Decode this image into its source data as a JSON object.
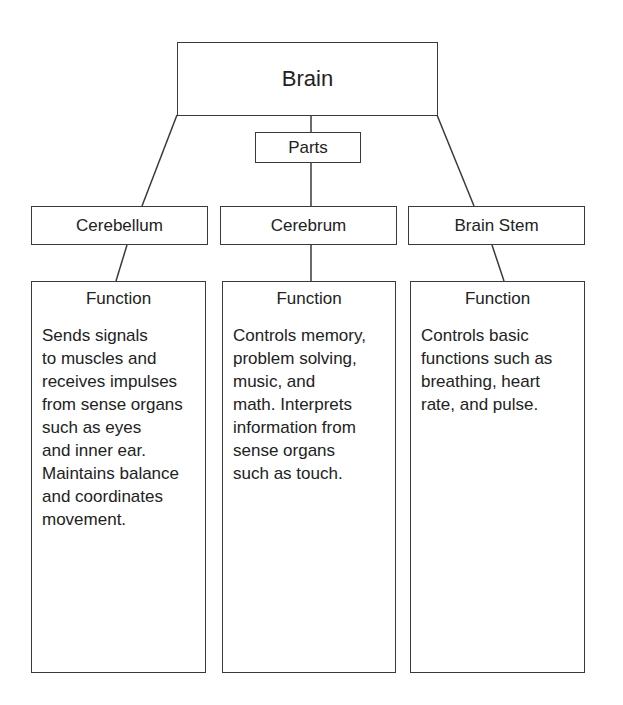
{
  "diagram": {
    "root": {
      "label": "Brain"
    },
    "connector": {
      "label": "Parts"
    },
    "parts": [
      {
        "name": "Cerebellum",
        "function_title": "Function",
        "function_text": "Sends signals\nto muscles and\nreceives impulses\nfrom sense organs\nsuch as eyes\nand inner ear.\nMaintains balance\nand coordinates\nmovement."
      },
      {
        "name": "Cerebrum",
        "function_title": "Function",
        "function_text": "Controls memory,\nproblem solving,\nmusic, and\nmath. Interprets\ninformation from\nsense organs\nsuch as touch."
      },
      {
        "name": "Brain Stem",
        "function_title": "Function",
        "function_text": "Controls basic\nfunctions such as\nbreathing, heart\nrate, and pulse."
      }
    ],
    "colors": {
      "line": "#3a3a3a",
      "text": "#222222",
      "background": "#ffffff"
    }
  }
}
